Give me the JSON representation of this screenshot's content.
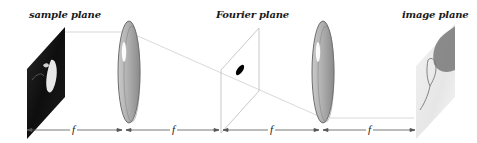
{
  "diagram": {
    "labels": {
      "sample_plane": "sample plane",
      "fourier_plane": "Fourier plane",
      "image_plane": "image plane"
    },
    "dimensions": [
      {
        "label": "f"
      },
      {
        "label": "f"
      },
      {
        "label": "f"
      },
      {
        "label": "f"
      }
    ],
    "components": [
      {
        "name": "sample plane",
        "type": "input object"
      },
      {
        "name": "lens 1",
        "type": "convex lens"
      },
      {
        "name": "Fourier plane",
        "type": "filter plane"
      },
      {
        "name": "lens 2",
        "type": "convex lens"
      },
      {
        "name": "image plane",
        "type": "output image"
      }
    ],
    "colors": {
      "lens_fill": "#a9a9a9",
      "lens_edge": "#6e6e6e",
      "ray": "#c8c8c8",
      "dimension_line": "#555555"
    }
  }
}
